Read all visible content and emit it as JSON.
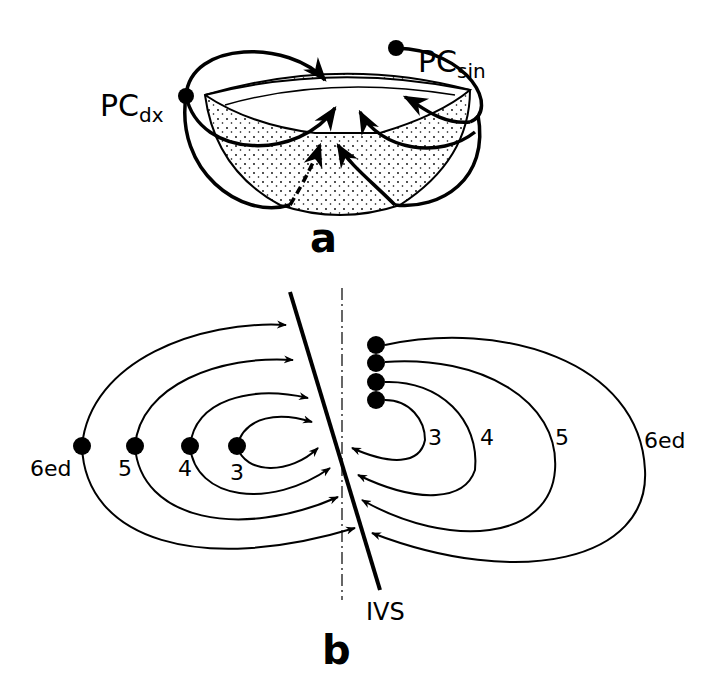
{
  "panel_a": {
    "label": "a",
    "pc_dx": {
      "main": "PC",
      "sub": "dx"
    },
    "pc_sin": {
      "main": "PC",
      "sub": "sin"
    }
  },
  "panel_b": {
    "label": "b",
    "septum_label": "IVS",
    "left_labels": [
      "6ed",
      "5",
      "4",
      "3"
    ],
    "right_labels": [
      "3",
      "4",
      "5",
      "6ed"
    ]
  },
  "colors": {
    "ink": "#000000",
    "background": "#ffffff"
  }
}
